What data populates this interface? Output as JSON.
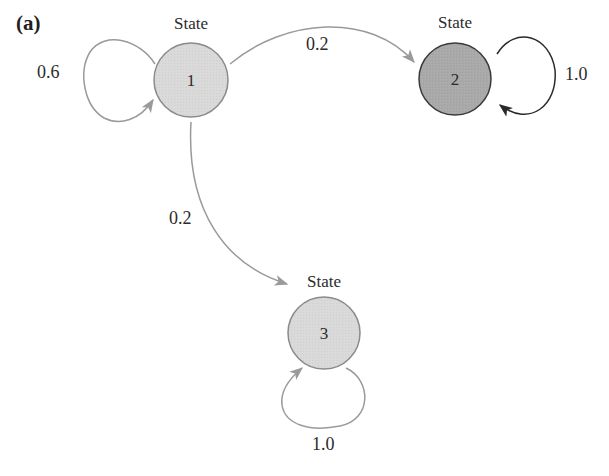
{
  "panel_label": "(a)",
  "colors": {
    "state_fill_light": "#d9d9d9",
    "state_fill_dark": "#a9a9a9",
    "state_stroke": "#8a8a8a",
    "state2_stroke": "#3a3a3a",
    "arrow_gray": "#9a9a9a",
    "arrow_dark": "#2a2a2a"
  },
  "states": [
    {
      "id": "1",
      "title": "State",
      "number": "1",
      "absorbing": false
    },
    {
      "id": "2",
      "title": "State",
      "number": "2",
      "absorbing": true
    },
    {
      "id": "3",
      "title": "State",
      "number": "3",
      "absorbing": true
    }
  ],
  "transitions": [
    {
      "from": "1",
      "to": "1",
      "probability": "0.6"
    },
    {
      "from": "1",
      "to": "2",
      "probability": "0.2"
    },
    {
      "from": "1",
      "to": "3",
      "probability": "0.2"
    },
    {
      "from": "2",
      "to": "2",
      "probability": "1.0"
    },
    {
      "from": "3",
      "to": "3",
      "probability": "1.0"
    }
  ]
}
